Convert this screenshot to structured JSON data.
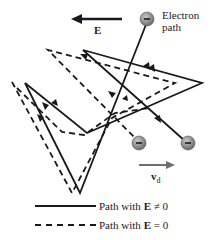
{
  "diagram": {
    "field_label": "E",
    "electron_label_line1": "Electron",
    "electron_label_line2": "path",
    "drift_velocity_label": "v",
    "drift_velocity_subscript": "d",
    "electron_symbol": "−",
    "legend": [
      {
        "style": "solid",
        "prefix": "Path with ",
        "symbol": "E",
        "suffix": " ≠ 0"
      },
      {
        "style": "dashed",
        "prefix": "Path with ",
        "symbol": "E",
        "suffix": " = 0"
      }
    ]
  },
  "colors": {
    "line": "#1a1a1a",
    "electron_fill": "#8c8c8c",
    "drift_arrow": "#6e6e6e"
  }
}
